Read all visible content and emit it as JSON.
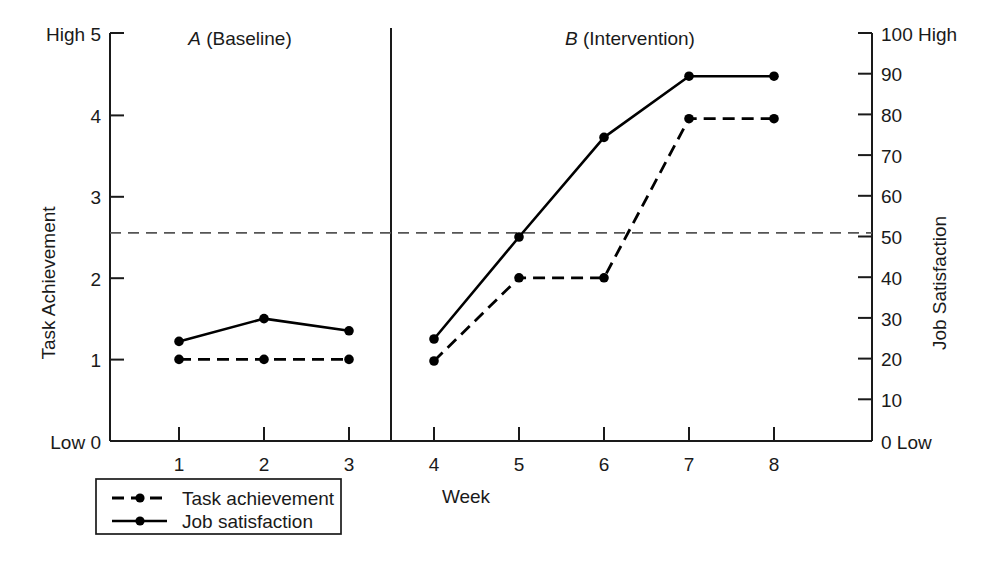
{
  "chart_data": {
    "type": "line",
    "title": "",
    "xlabel": "Week",
    "x": [
      1,
      2,
      3,
      4,
      5,
      6,
      7,
      8
    ],
    "xtick_labels": [
      "1",
      "2",
      "3",
      "4",
      "5",
      "6",
      "7",
      "8"
    ],
    "grid": false,
    "legend_position": "below-left",
    "left_axis": {
      "label": "Task Achievement",
      "ylim": [
        0,
        5
      ],
      "ticks": [
        0,
        1,
        2,
        3,
        4,
        5
      ],
      "tick_labels": [
        "0",
        "1",
        "2",
        "3",
        "4",
        "5"
      ],
      "low_anchor": "Low",
      "high_anchor": "High",
      "low_label": "Low 0",
      "high_label": "High 5"
    },
    "right_axis": {
      "label": "Job Satisfaction",
      "ylim": [
        0,
        100
      ],
      "ticks": [
        0,
        10,
        20,
        30,
        40,
        50,
        60,
        70,
        80,
        90,
        100
      ],
      "tick_labels": [
        "0",
        "10",
        "20",
        "30",
        "40",
        "50",
        "60",
        "70",
        "80",
        "90",
        "100"
      ],
      "low_anchor": "Low",
      "high_anchor": "High",
      "low_label": "0 Low",
      "high_label": "100 High"
    },
    "phases": [
      {
        "letter": "A",
        "name": "(Baseline)",
        "label": "A (Baseline)",
        "weeks": [
          1,
          2,
          3
        ]
      },
      {
        "letter": "B",
        "name": "(Intervention)",
        "label": "B (Intervention)",
        "weeks": [
          4,
          5,
          6,
          7,
          8
        ]
      }
    ],
    "phase_change_at": 3.5,
    "criterion_line": {
      "left_value": 2.55,
      "right_value": 51,
      "style": "dashed",
      "color": "#555555"
    },
    "series": [
      {
        "name": "Task achievement",
        "axis": "left",
        "style": "dashed",
        "marker": "filled-circle",
        "values": [
          1.0,
          1.0,
          1.0,
          0.98,
          2.0,
          2.0,
          3.95,
          3.95
        ],
        "values_right_scale": [
          20,
          20,
          20,
          19.6,
          40,
          40,
          79,
          79
        ]
      },
      {
        "name": "Job satisfaction",
        "axis": "right",
        "style": "solid",
        "marker": "filled-circle",
        "values": [
          1.22,
          1.5,
          1.35,
          1.25,
          2.5,
          3.72,
          4.47,
          4.47
        ],
        "values_right_scale": [
          24.4,
          30,
          27,
          25,
          50,
          74.4,
          89.4,
          89.4
        ]
      }
    ]
  },
  "legend": {
    "items": [
      {
        "label": "Task achievement",
        "style": "dashed"
      },
      {
        "label": "Job satisfaction",
        "style": "solid"
      }
    ]
  }
}
